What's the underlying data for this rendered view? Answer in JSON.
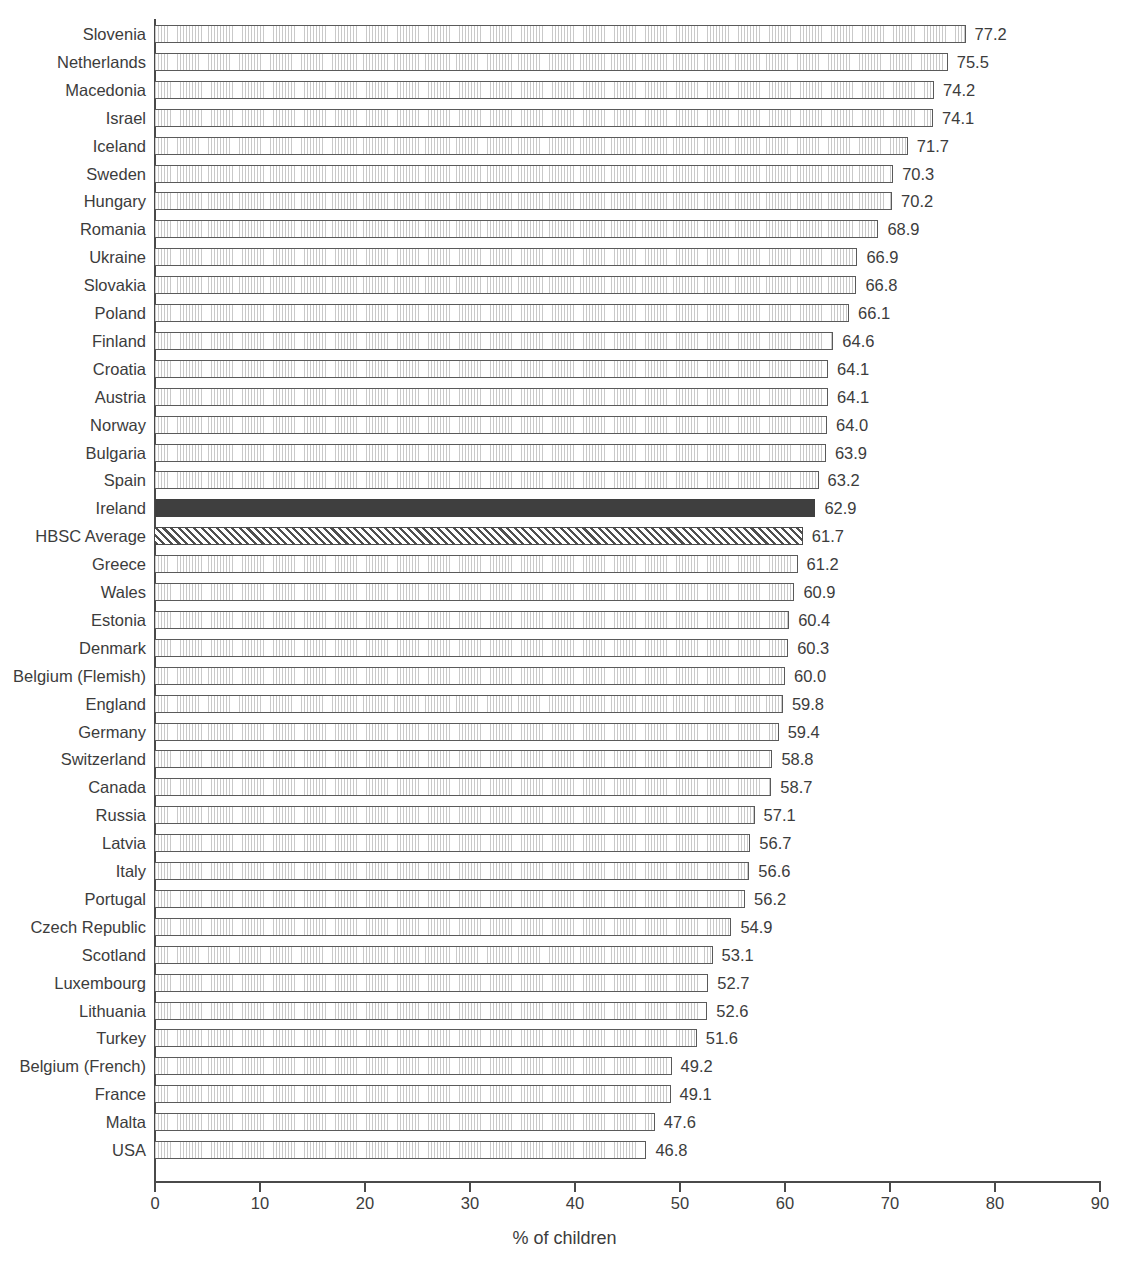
{
  "chart_data": {
    "type": "bar",
    "orientation": "horizontal",
    "title": "",
    "subtitle": "",
    "xlabel": "% of children",
    "ylabel": "",
    "xlim": [
      0,
      90
    ],
    "xticks": [
      0,
      10,
      20,
      30,
      40,
      50,
      60,
      70,
      80,
      90
    ],
    "xtick_labels": [
      "0",
      "10",
      "20",
      "30",
      "40",
      "50",
      "60",
      "70",
      "80",
      "90"
    ],
    "grid": false,
    "legend": "none",
    "sorted": "descending",
    "categories": [
      "Slovenia",
      "Netherlands",
      "Macedonia",
      "Israel",
      "Iceland",
      "Sweden",
      "Hungary",
      "Romania",
      "Ukraine",
      "Slovakia",
      "Poland",
      "Finland",
      "Croatia",
      "Austria",
      "Norway",
      "Bulgaria",
      "Spain",
      "Ireland",
      "HBSC Average",
      "Greece",
      "Wales",
      "Estonia",
      "Denmark",
      "Belgium (Flemish)",
      "England",
      "Germany",
      "Switzerland",
      "Canada",
      "Russia",
      "Latvia",
      "Italy",
      "Portugal",
      "Czech Republic",
      "Scotland",
      "Luxembourg",
      "Lithuania",
      "Turkey",
      "Belgium (French)",
      "France",
      "Malta",
      "USA"
    ],
    "values": [
      77.2,
      75.5,
      74.2,
      74.1,
      71.7,
      70.3,
      70.2,
      68.9,
      66.9,
      66.8,
      66.1,
      64.6,
      64.1,
      64.1,
      64.0,
      63.9,
      63.2,
      62.9,
      61.7,
      61.2,
      60.9,
      60.4,
      60.3,
      60.0,
      59.8,
      59.4,
      58.8,
      58.7,
      57.1,
      56.7,
      56.6,
      56.2,
      54.9,
      53.1,
      52.7,
      52.6,
      51.6,
      49.2,
      49.1,
      47.6,
      46.8
    ],
    "value_labels": [
      "77.2",
      "75.5",
      "74.2",
      "74.1",
      "71.7",
      "70.3",
      "70.2",
      "68.9",
      "66.9",
      "66.8",
      "66.1",
      "64.6",
      "64.1",
      "64.1",
      "64.0",
      "63.9",
      "63.2",
      "62.9",
      "61.7",
      "61.2",
      "60.9",
      "60.4",
      "60.3",
      "60.0",
      "59.8",
      "59.4",
      "58.8",
      "58.7",
      "57.1",
      "56.7",
      "56.6",
      "56.2",
      "54.9",
      "53.1",
      "52.7",
      "52.6",
      "51.6",
      "49.2",
      "49.1",
      "47.6",
      "46.8"
    ],
    "styles": [
      "hatch-fine",
      "hatch-fine",
      "hatch-fine",
      "hatch-fine",
      "hatch-fine",
      "hatch-fine",
      "hatch-fine",
      "hatch-fine",
      "hatch-fine",
      "hatch-fine",
      "hatch-fine",
      "hatch-fine",
      "hatch-fine",
      "hatch-fine",
      "hatch-fine",
      "hatch-fine",
      "hatch-fine",
      "solid-dark",
      "hatch-diagonal",
      "hatch-fine",
      "hatch-fine",
      "hatch-fine",
      "hatch-fine",
      "hatch-fine",
      "hatch-fine",
      "hatch-fine",
      "hatch-fine",
      "hatch-fine",
      "hatch-fine",
      "hatch-fine",
      "hatch-fine",
      "hatch-fine",
      "hatch-fine",
      "hatch-fine",
      "hatch-fine",
      "hatch-fine",
      "hatch-fine",
      "hatch-fine",
      "hatch-fine",
      "hatch-fine",
      "hatch-fine"
    ],
    "highlight_category": "Ireland",
    "average_category": "HBSC Average"
  },
  "colors": {
    "axis": "#4a4a4a",
    "text": "#3c3c3c",
    "bar_outline": "#5a5a5a",
    "bar_fill": "#fdfdfd",
    "highlight_fill": "#3f3f3f",
    "average_hatch": "#4f4f4f",
    "background": "#ffffff"
  }
}
